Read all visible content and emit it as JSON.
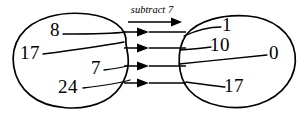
{
  "diagram": {
    "type": "mapping-diagram",
    "operation_label": "subtract 7",
    "input_set": {
      "name": "input-oval",
      "values": [
        "8",
        "17",
        "7",
        "24"
      ]
    },
    "output_set": {
      "name": "output-oval",
      "values": [
        "1",
        "10",
        "0",
        "17"
      ]
    },
    "mappings": [
      {
        "from": "8",
        "to": "1"
      },
      {
        "from": "17",
        "to": "10"
      },
      {
        "from": "7",
        "to": "0"
      },
      {
        "from": "24",
        "to": "17"
      }
    ],
    "colors": {
      "ink": "#000000",
      "background": "#ffffff"
    },
    "arrow_count": 4
  }
}
